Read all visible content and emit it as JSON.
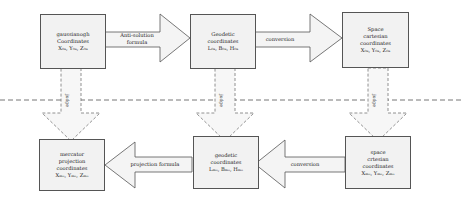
{
  "diagram": {
    "top_row": [
      {
        "id": "gauss",
        "lines": [
          "gaussianogh",
          "Coordinates",
          "X₀ₐ, Y₀ₐ, Z₀ₐ"
        ]
      },
      {
        "id": "geodetic-top",
        "lines": [
          "Geodetic",
          "coordinates",
          "L₀ₐ, B₀ₐ, H₀ₐ"
        ]
      },
      {
        "id": "space-top",
        "lines": [
          "Space",
          "cartesian",
          "coordinates",
          "X₀ₐ, Y₀ₐ, Z₀ₐ"
        ]
      }
    ],
    "bottom_row": [
      {
        "id": "mercator",
        "lines": [
          "mercator",
          "projection",
          "coordinates",
          "Xₘₒ, Yₘₒ, Zₘₒ"
        ]
      },
      {
        "id": "geodetic-bottom",
        "lines": [
          "geodetic",
          "coordinates",
          "Lₘₒ, Bₘₒ, Hₘₒ"
        ]
      },
      {
        "id": "space-bottom",
        "lines": [
          "space",
          "crtesian",
          "coordinates",
          "Xₘₒ, Yₘₒ, Zₘₒ"
        ]
      }
    ],
    "arrows_top": [
      {
        "label_lines": [
          "Anti-solution",
          "formula"
        ]
      },
      {
        "label_lines": [
          "conversion"
        ]
      }
    ],
    "arrows_bottom": [
      {
        "label_lines": [
          "projection formula"
        ]
      },
      {
        "label_lines": [
          "conversion"
        ]
      }
    ],
    "vertical_arrows": [
      {
        "label": "judge"
      },
      {
        "label": "judge"
      },
      {
        "label": "judge"
      }
    ],
    "colors": {
      "box_fill": "#f2f2f2",
      "stroke": "#555555",
      "dashed": "#777777"
    }
  }
}
